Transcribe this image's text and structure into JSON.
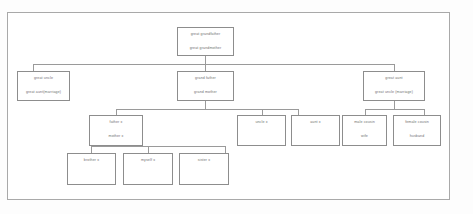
{
  "diagram": {
    "frame": {
      "border_color": "#a9a9a9"
    },
    "box_border_color": "#8d8d8d",
    "text_color": "#6f6f6f",
    "connector_color": "#9a9a9a",
    "nodes": {
      "great_grandparents": {
        "line1": "great grandfather",
        "line2": "great grandmother"
      },
      "great_uncle": {
        "line1": "great uncle",
        "line2": "great aunt(marriage)"
      },
      "grandparents": {
        "line1": "grand father",
        "line2": "grand mother"
      },
      "great_aunt": {
        "line1": "great aunt",
        "line2": "great uncle (marriage)"
      },
      "parents": {
        "line1": "father x",
        "line2": "mother x"
      },
      "uncle": {
        "line1": "uncle x"
      },
      "aunt": {
        "line1": "aunt x"
      },
      "male_cousin": {
        "line1": "male cousin",
        "line2": "wife"
      },
      "female_cousin": {
        "line1": "female cousin",
        "line2": "husband"
      },
      "brother": {
        "line1": "brother x"
      },
      "myself": {
        "line1": "myself x"
      },
      "sister": {
        "line1": "sister x"
      }
    }
  }
}
